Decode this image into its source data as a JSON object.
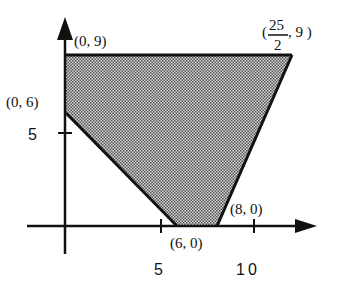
{
  "diagram": {
    "type": "feasible-region",
    "axes": {
      "x_ticks": [
        {
          "value": 5,
          "label": "5"
        },
        {
          "value": 10,
          "label": "10"
        }
      ],
      "y_ticks": [
        {
          "value": 5,
          "label": "5"
        }
      ]
    },
    "region": {
      "fill": "#b8b8b8",
      "stroke": "#111111",
      "vertices": [
        {
          "x": 0,
          "y": 9,
          "label": "(0, 9)"
        },
        {
          "x": 12.5,
          "y": 9,
          "label_open": "(",
          "label_num": "25",
          "label_den": "2",
          "label_close": ", 9 )"
        },
        {
          "x": 8,
          "y": 0,
          "label": "(8, 0)"
        },
        {
          "x": 6,
          "y": 0,
          "label": "(6, 0)"
        },
        {
          "x": 0,
          "y": 6,
          "label": "(0, 6)"
        }
      ]
    }
  }
}
